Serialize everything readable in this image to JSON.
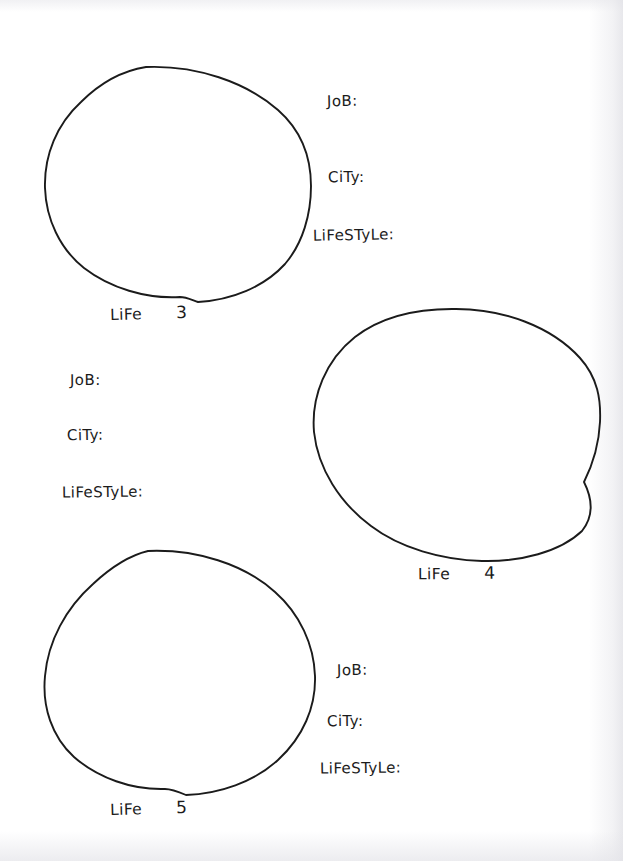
{
  "page": {
    "background_color": "#ffffff",
    "ink_color": "#1b1b1b",
    "width": 623,
    "height": 861
  },
  "sections": [
    {
      "id": "life-3",
      "caption_word": "LiFe",
      "caption_number": "3",
      "circle": {
        "cx": 178,
        "cy": 184,
        "rx": 133,
        "ry": 118
      },
      "fields": [
        {
          "label": "JoB:"
        },
        {
          "label": "CiTy:"
        },
        {
          "label": "LiFeSTyLe:"
        }
      ]
    },
    {
      "id": "life-4",
      "caption_word": "LiFe",
      "caption_number": "4",
      "circle": {
        "cx": 457,
        "cy": 434,
        "rx": 144,
        "ry": 126
      },
      "fields": [
        {
          "label": "JoB:"
        },
        {
          "label": "CiTy:"
        },
        {
          "label": "LiFeSTyLe:"
        }
      ]
    },
    {
      "id": "life-5",
      "caption_word": "LiFe",
      "caption_number": "5",
      "circle": {
        "cx": 180,
        "cy": 672,
        "rx": 135,
        "ry": 122
      },
      "fields": [
        {
          "label": "JoB:"
        },
        {
          "label": "CiTy:"
        },
        {
          "label": "LiFeSTyLe:"
        }
      ]
    }
  ]
}
